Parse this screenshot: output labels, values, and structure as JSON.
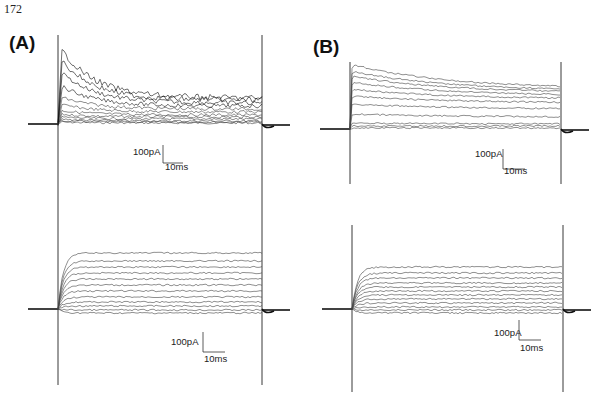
{
  "page": {
    "number": "172"
  },
  "panels": {
    "A": {
      "label": "(A)"
    },
    "B": {
      "label": "(B)"
    }
  },
  "scale_bars": {
    "current": "100pA",
    "time": "10ms"
  },
  "chart_data": [
    {
      "id": "A-top",
      "type": "line",
      "title": "(A) upper: whole-cell current traces, families of voltage steps",
      "xlabel": "time",
      "ylabel": "current",
      "scale_bar": {
        "current": "100pA",
        "time": "10ms"
      },
      "layout": {
        "x0": 58,
        "x1": 262,
        "baseline_y": 124,
        "stim_top": 35,
        "stim_bottom": 200,
        "px_per_100pA": 18,
        "px_per_10ms": 20
      },
      "trace_shape": "inactivating",
      "series": [
        {
          "name": "step1",
          "peak": 2,
          "steady": 1
        },
        {
          "name": "step2",
          "peak": 3,
          "steady": 2
        },
        {
          "name": "step3",
          "peak": 5,
          "steady": 3
        },
        {
          "name": "step4",
          "peak": 7,
          "steady": 5
        },
        {
          "name": "step5",
          "peak": 10,
          "steady": 7
        },
        {
          "name": "step6",
          "peak": 14,
          "steady": 9
        },
        {
          "name": "step7",
          "peak": 20,
          "steady": 12
        },
        {
          "name": "step8",
          "peak": 28,
          "steady": 15
        },
        {
          "name": "step9",
          "peak": 40,
          "steady": 18
        },
        {
          "name": "step10",
          "peak": 55,
          "steady": 21
        },
        {
          "name": "step11",
          "peak": 68,
          "steady": 24
        },
        {
          "name": "step12",
          "peak": 80,
          "steady": 26
        }
      ]
    },
    {
      "id": "A-bottom",
      "type": "line",
      "title": "(A) lower: current traces with sustained (non-inactivating) component",
      "xlabel": "time",
      "ylabel": "current",
      "scale_bar": {
        "current": "100pA",
        "time": "10ms"
      },
      "layout": {
        "x0": 58,
        "x1": 262,
        "baseline_y": 309,
        "stim_top": 200,
        "stim_bottom": 385,
        "px_per_100pA": 20,
        "px_per_10ms": 22
      },
      "trace_shape": "sustained",
      "series": [
        {
          "name": "step1",
          "peak": -4,
          "steady": -4
        },
        {
          "name": "step2",
          "peak": -1,
          "steady": -1
        },
        {
          "name": "step3",
          "peak": 3,
          "steady": 3
        },
        {
          "name": "step4",
          "peak": 7,
          "steady": 7
        },
        {
          "name": "step5",
          "peak": 12,
          "steady": 12
        },
        {
          "name": "step6",
          "peak": 18,
          "steady": 18
        },
        {
          "name": "step7",
          "peak": 24,
          "steady": 24
        },
        {
          "name": "step8",
          "peak": 30,
          "steady": 30
        },
        {
          "name": "step9",
          "peak": 36,
          "steady": 36
        },
        {
          "name": "step10",
          "peak": 42,
          "steady": 42
        },
        {
          "name": "step11",
          "peak": 48,
          "steady": 48
        },
        {
          "name": "step12",
          "peak": 56,
          "steady": 56
        }
      ]
    },
    {
      "id": "B-top",
      "type": "line",
      "title": "(B) upper: current traces, slowly inactivating",
      "xlabel": "time",
      "ylabel": "current",
      "scale_bar": {
        "current": "100pA",
        "time": "10ms"
      },
      "layout": {
        "x0": 350,
        "x1": 561,
        "baseline_y": 129,
        "stim_top": 62,
        "stim_bottom": 184,
        "px_per_100pA": 20,
        "px_per_10ms": 22
      },
      "trace_shape": "slow-inactivating",
      "series": [
        {
          "name": "step1",
          "peak": 1,
          "steady": 1
        },
        {
          "name": "step2",
          "peak": 3,
          "steady": 3
        },
        {
          "name": "step3",
          "peak": 6,
          "steady": 5
        },
        {
          "name": "step4",
          "peak": 15,
          "steady": 12
        },
        {
          "name": "step5",
          "peak": 25,
          "steady": 20
        },
        {
          "name": "step6",
          "peak": 33,
          "steady": 26
        },
        {
          "name": "step7",
          "peak": 40,
          "steady": 30
        },
        {
          "name": "step8",
          "peak": 47,
          "steady": 33
        },
        {
          "name": "step9",
          "peak": 53,
          "steady": 36
        },
        {
          "name": "step10",
          "peak": 58,
          "steady": 38
        },
        {
          "name": "step11",
          "peak": 65,
          "steady": 40
        }
      ]
    },
    {
      "id": "B-bottom",
      "type": "line",
      "title": "(B) lower: sustained current traces",
      "xlabel": "time",
      "ylabel": "current",
      "scale_bar": {
        "current": "100pA",
        "time": "10ms"
      },
      "layout": {
        "x0": 352,
        "x1": 563,
        "baseline_y": 309,
        "stim_top": 225,
        "stim_bottom": 392,
        "px_per_100pA": 20,
        "px_per_10ms": 22
      },
      "trace_shape": "sustained",
      "series": [
        {
          "name": "step1",
          "peak": -4,
          "steady": -4
        },
        {
          "name": "step2",
          "peak": -1,
          "steady": -1
        },
        {
          "name": "step3",
          "peak": 2,
          "steady": 2
        },
        {
          "name": "step4",
          "peak": 6,
          "steady": 6
        },
        {
          "name": "step5",
          "peak": 10,
          "steady": 10
        },
        {
          "name": "step6",
          "peak": 14,
          "steady": 14
        },
        {
          "name": "step7",
          "peak": 18,
          "steady": 18
        },
        {
          "name": "step8",
          "peak": 22,
          "steady": 22
        },
        {
          "name": "step9",
          "peak": 26,
          "steady": 26
        },
        {
          "name": "step10",
          "peak": 31,
          "steady": 31
        },
        {
          "name": "step11",
          "peak": 36,
          "steady": 36
        },
        {
          "name": "step12",
          "peak": 42,
          "steady": 42
        }
      ]
    }
  ],
  "scale_bar_positions": {
    "A-top": {
      "x": 163,
      "y": 145,
      "v_len": 18,
      "h_len": 20,
      "text_x": 133,
      "text_y": 155,
      "time_x": 165,
      "time_y": 170
    },
    "A-bottom": {
      "x": 203,
      "y": 332,
      "v_len": 20,
      "h_len": 22,
      "text_x": 171,
      "text_y": 345,
      "time_x": 204,
      "time_y": 362
    },
    "B-top": {
      "x": 503,
      "y": 149,
      "v_len": 20,
      "h_len": 22,
      "text_x": 475,
      "text_y": 157,
      "time_x": 504,
      "time_y": 174
    },
    "B-bottom": {
      "x": 519,
      "y": 320,
      "v_len": 20,
      "h_len": 22,
      "text_x": 494,
      "text_y": 336,
      "time_x": 520,
      "time_y": 351
    }
  }
}
